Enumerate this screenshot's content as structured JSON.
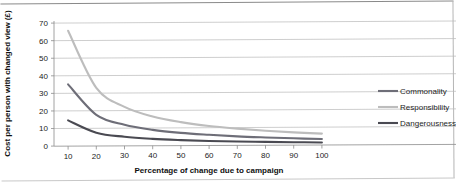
{
  "chart_data": {
    "type": "line",
    "title": "",
    "xlabel": "Percentage of change due to campaign",
    "ylabel": "Cost per person with changed view (£)",
    "xlim": [
      5,
      105
    ],
    "ylim": [
      0,
      70
    ],
    "xticks": [
      "10",
      "20",
      "30",
      "40",
      "50",
      "60",
      "70",
      "80",
      "90",
      "100"
    ],
    "yticks": [
      "0",
      "10",
      "20",
      "30",
      "40",
      "50",
      "60",
      "70"
    ],
    "x": [
      10,
      20,
      30,
      40,
      50,
      60,
      70,
      80,
      90,
      100
    ],
    "grid": "horizontal",
    "legend_position": "right",
    "series": [
      {
        "name": "Commonality",
        "color": "#6e6e78",
        "values": [
          34.5,
          17.2,
          11.5,
          8.6,
          6.9,
          5.8,
          4.9,
          4.3,
          3.8,
          3.4
        ]
      },
      {
        "name": "Responsibility",
        "color": "#bdbdbd",
        "values": [
          65.0,
          32.5,
          21.7,
          16.2,
          13.0,
          10.8,
          9.3,
          8.1,
          7.2,
          6.5
        ]
      },
      {
        "name": "Dangerousness",
        "color": "#4a4a52",
        "values": [
          14.0,
          7.0,
          4.7,
          3.5,
          2.8,
          2.3,
          2.0,
          1.8,
          1.6,
          1.4
        ]
      }
    ]
  },
  "legend": {
    "items": [
      {
        "label": "Commonality"
      },
      {
        "label": "Responsibility"
      },
      {
        "label": "Dangerousness"
      }
    ]
  }
}
